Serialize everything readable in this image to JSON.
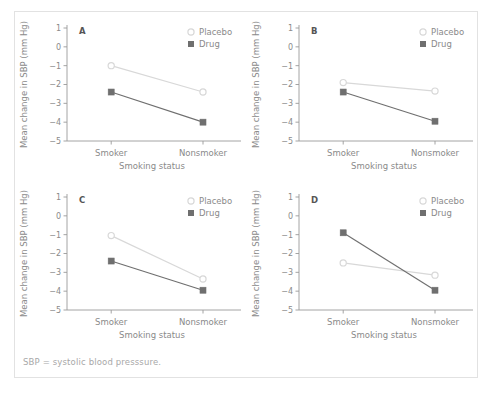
{
  "figure": {
    "top_caption": "",
    "footnote": "SBP = systolic blood presssure."
  },
  "axes": {
    "ylabel": "Mean change in SBP (mm Hg)",
    "xlabel": "Smoking status",
    "ytick_labels": [
      "1",
      "0",
      "−1",
      "−2",
      "−3",
      "−4",
      "−5"
    ],
    "ytick_values": [
      1,
      0,
      -1,
      -2,
      -3,
      -4,
      -5
    ],
    "categories": [
      "Smoker",
      "Nonsmoker"
    ],
    "ylim": [
      -5,
      1
    ]
  },
  "legend": {
    "placebo_label": "Placebo",
    "drug_label": "Drug"
  },
  "colors": {
    "placebo": "#d8d8d8",
    "drug": "#6f6f6f",
    "axis": "#9a9a9a",
    "text": "#8a8a8a",
    "frame": "#e2e2e2"
  },
  "panels": [
    {
      "letter": "A"
    },
    {
      "letter": "B"
    },
    {
      "letter": "C"
    },
    {
      "letter": "D"
    }
  ],
  "chart_data": [
    {
      "type": "line",
      "title": "A",
      "xlabel": "Smoking status",
      "ylabel": "Mean change in SBP (mm Hg)",
      "categories": [
        "Smoker",
        "Nonsmoker"
      ],
      "ylim": [
        -5,
        1
      ],
      "grid": false,
      "legend_position": "top-right",
      "series": [
        {
          "name": "Placebo",
          "values": [
            -1.0,
            -2.4
          ],
          "marker": "open-circle",
          "color": "#d8d8d8"
        },
        {
          "name": "Drug",
          "values": [
            -2.4,
            -4.0
          ],
          "marker": "filled-square",
          "color": "#6f6f6f"
        }
      ],
      "annotation": "Parallel lines: no interaction"
    },
    {
      "type": "line",
      "title": "B",
      "xlabel": "Smoking status",
      "ylabel": "Mean change in SBP (mm Hg)",
      "categories": [
        "Smoker",
        "Nonsmoker"
      ],
      "ylim": [
        -5,
        1
      ],
      "grid": false,
      "legend_position": "top-right",
      "series": [
        {
          "name": "Placebo",
          "values": [
            -1.9,
            -2.35
          ],
          "marker": "open-circle",
          "color": "#d8d8d8"
        },
        {
          "name": "Drug",
          "values": [
            -2.4,
            -3.95
          ],
          "marker": "filled-square",
          "color": "#6f6f6f"
        }
      ],
      "annotation": "Diverging lines: interaction"
    },
    {
      "type": "line",
      "title": "C",
      "xlabel": "Smoking status",
      "ylabel": "Mean change in SBP (mm Hg)",
      "categories": [
        "Smoker",
        "Nonsmoker"
      ],
      "ylim": [
        -5,
        1
      ],
      "grid": false,
      "legend_position": "top-right",
      "series": [
        {
          "name": "Placebo",
          "values": [
            -1.05,
            -3.35
          ],
          "marker": "open-circle",
          "color": "#d8d8d8"
        },
        {
          "name": "Drug",
          "values": [
            -2.4,
            -3.95
          ],
          "marker": "filled-square",
          "color": "#6f6f6f"
        }
      ],
      "annotation": "Converging lines: interaction"
    },
    {
      "type": "line",
      "title": "D",
      "xlabel": "Smoking status",
      "ylabel": "Mean change in SBP (mm Hg)",
      "categories": [
        "Smoker",
        "Nonsmoker"
      ],
      "ylim": [
        -5,
        1
      ],
      "grid": false,
      "legend_position": "top-right",
      "series": [
        {
          "name": "Placebo",
          "values": [
            -2.5,
            -3.15
          ],
          "marker": "open-circle",
          "color": "#d8d8d8"
        },
        {
          "name": "Drug",
          "values": [
            -0.9,
            -3.95
          ],
          "marker": "filled-square",
          "color": "#6f6f6f"
        }
      ],
      "annotation": "Crossing lines: qualitative interaction"
    }
  ]
}
